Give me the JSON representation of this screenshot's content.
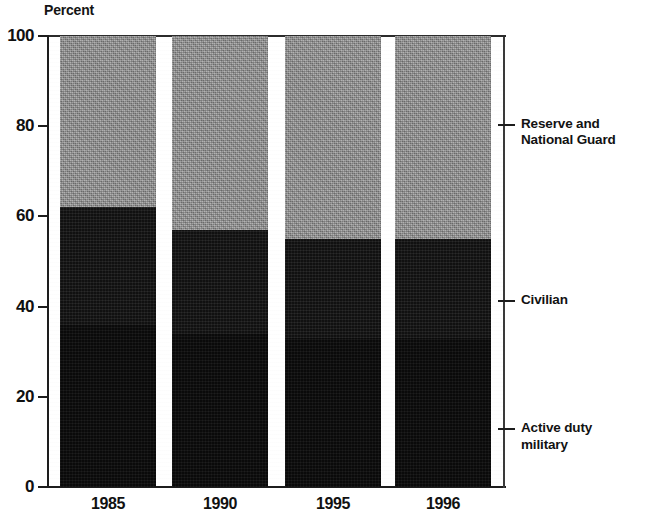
{
  "chart_data": {
    "type": "bar",
    "subtype": "stacked-percent",
    "title": "",
    "axis_title": "Percent",
    "xlabel": "",
    "ylabel": "Percent",
    "ylim": [
      0,
      100
    ],
    "yticks": [
      0,
      20,
      40,
      60,
      80,
      100
    ],
    "ytick_labels": [
      "0",
      "20",
      "40",
      "60",
      "80",
      "100"
    ],
    "grid": false,
    "legend_position": "right-callouts",
    "categories": [
      "1985",
      "1990",
      "1995",
      "1996"
    ],
    "series": [
      {
        "name": "Active duty military",
        "color": "#0c0c0c",
        "values": [
          36,
          34,
          33,
          33
        ]
      },
      {
        "name": "Civilian",
        "color": "#141414",
        "values": [
          26,
          23,
          22,
          22
        ]
      },
      {
        "name": "Reserve and National Guard",
        "color": "#8b8b8b",
        "values": [
          38,
          43,
          45,
          45
        ]
      }
    ],
    "cumulative_tops": {
      "active_duty_military": [
        36,
        34,
        33,
        33
      ],
      "civilian": [
        62,
        57,
        55,
        55
      ],
      "reserve_and_national_guard": [
        100,
        100,
        100,
        100
      ]
    },
    "legend": [
      {
        "label": "Reserve and\nNational Guard",
        "anchor_percent": 80.5
      },
      {
        "label": "Civilian",
        "anchor_percent": 41.5
      },
      {
        "label": "Active duty\nmilitary",
        "anchor_percent": 13.0
      }
    ]
  },
  "colors": {
    "reserve": "#8b8b8b",
    "civilian": "#141414",
    "active": "#0c0c0c",
    "axis": "#1d1d1d",
    "text": "#111111",
    "background": "#ffffff"
  }
}
